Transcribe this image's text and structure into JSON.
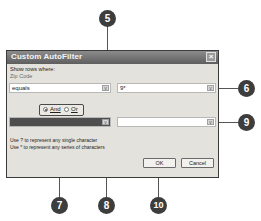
{
  "dialog": {
    "title": "Custom AutoFilter",
    "close_icon": "close-icon",
    "show_rows_label": "Show rows where:",
    "field_label": "Zip Code",
    "criteria1": {
      "operator": "equals",
      "value": "9*"
    },
    "logic": {
      "and_label": "And",
      "or_label": "Or",
      "selected": "And"
    },
    "criteria2": {
      "operator": "",
      "value": ""
    },
    "hints": [
      "Use ? to represent any single character",
      "Use * to represent any series of characters"
    ],
    "buttons": {
      "ok": "OK",
      "cancel": "Cancel"
    }
  },
  "callouts": [
    "5",
    "6",
    "7",
    "8",
    "9",
    "10"
  ],
  "colors": {
    "titlebar": "#6e6e6e",
    "callout": "#3d3d3d",
    "dialog_bg": "#e4e2dc"
  }
}
